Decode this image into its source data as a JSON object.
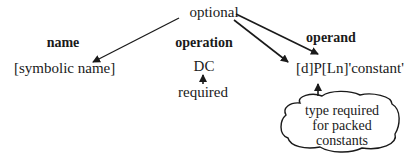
{
  "diagram": {
    "top_label": "optional",
    "columns": {
      "name": {
        "heading": "name",
        "value": "[symbolic name]"
      },
      "operation": {
        "heading": "operation",
        "value": "DC",
        "note": "required"
      },
      "operand": {
        "heading": "operand",
        "value": "[d]P[Ln]'constant'"
      }
    },
    "cloud": {
      "lines": [
        "type required",
        "for packed",
        "constants"
      ]
    },
    "arrows": [
      {
        "from": "optional",
        "to": "[symbolic name]"
      },
      {
        "from": "optional",
        "to": "[d]"
      },
      {
        "from": "optional",
        "to": "[Ln]"
      },
      {
        "from": "required",
        "to": "DC"
      },
      {
        "from": "cloud",
        "to": "P"
      }
    ],
    "colors": {
      "ink": "#1a1a1a",
      "background": "#ffffff"
    }
  }
}
